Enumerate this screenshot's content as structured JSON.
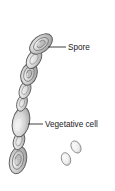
{
  "figure": {
    "background_color": "#ffffff",
    "outline_color": "#5a5a5a",
    "fill_light": "#e2e2e2",
    "fill_mid": "#c9c9c9",
    "fill_dark": "#a8a8a8",
    "text_color": "#1a1a1a"
  },
  "labels": {
    "spore": "Spore",
    "vegetative_cell": "Vegetative cell"
  },
  "leader_lines": [
    {
      "name": "spore-leader",
      "x1": 48,
      "y1": 47,
      "x2": 66,
      "y2": 47
    },
    {
      "name": "vegetative-cell-leader",
      "x1": 28,
      "y1": 124,
      "x2": 43,
      "y2": 124
    }
  ],
  "chain": {
    "angle_deg": 20,
    "cells": [
      {
        "index": 1,
        "type": "spore",
        "cx": 41,
        "cy": 44,
        "rx": 11,
        "ry": 7.5,
        "rot": -38
      },
      {
        "index": 2,
        "type": "vegetative",
        "cx": 33,
        "cy": 60,
        "rx": 11,
        "ry": 7,
        "rot": -60
      },
      {
        "index": 3,
        "type": "spore",
        "cx": 29,
        "cy": 74,
        "rx": 10.5,
        "ry": 7.5,
        "rot": -72
      },
      {
        "index": 4,
        "type": "vegetative",
        "cx": 25,
        "cy": 90,
        "rx": 9,
        "ry": 5.5,
        "rot": -70
      },
      {
        "index": 5,
        "type": "vegetative",
        "cx": 22,
        "cy": 103,
        "rx": 8.5,
        "ry": 5,
        "rot": -72
      },
      {
        "index": 6,
        "type": "vegetative-large",
        "cx": 21,
        "cy": 122,
        "rx": 15,
        "ry": 8.5,
        "rot": -78
      },
      {
        "index": 7,
        "type": "vegetative",
        "cx": 19,
        "cy": 141,
        "rx": 9,
        "ry": 5.5,
        "rot": -74
      },
      {
        "index": 8,
        "type": "spore",
        "cx": 18,
        "cy": 160,
        "rx": 14,
        "ry": 8.5,
        "rot": -78
      }
    ]
  },
  "free_spores": [
    {
      "name": "free-spore-1",
      "cx": 76,
      "cy": 147,
      "rx": 4.5,
      "ry": 6.5,
      "rot": -30
    },
    {
      "name": "free-spore-2",
      "cx": 66,
      "cy": 159,
      "rx": 4.5,
      "ry": 6.5,
      "rot": -18
    }
  ]
}
